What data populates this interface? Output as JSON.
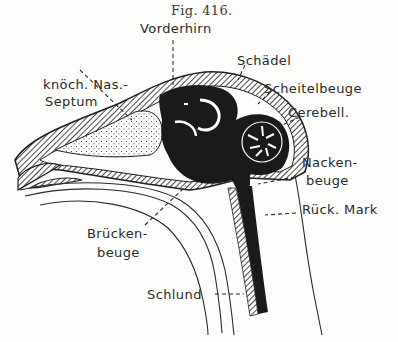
{
  "figure": {
    "caption": "Fig. 416.",
    "labels": {
      "vorderhirn": "Vorderhirn",
      "schaedel": "Schädel",
      "nasal_septum_line1": "knöch. Nas.-",
      "nasal_septum_line2": "Septum",
      "scheitelbeuge": "Scheitelbeuge",
      "cerebell": "Cerebell.",
      "nackenbeuge_line1": "Nacken-",
      "nackenbeuge_line2": "beuge",
      "rueckenmark": "Rück. Mark",
      "brueckenbeuge_line1": "Brücken-",
      "brueckenbeuge_line2": "beuge",
      "schlund": "Schlund"
    },
    "colors": {
      "ink": "#1e1e1e",
      "paper": "#fdfdfb"
    }
  }
}
